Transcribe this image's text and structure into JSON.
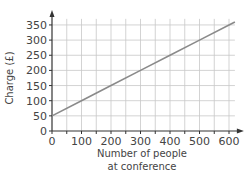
{
  "chart_data": {
    "type": "line",
    "title": "",
    "xlabel": "Number of people at conference",
    "xlabel_lines": [
      "Number of people",
      "at conference"
    ],
    "ylabel": "Charge (£)",
    "x_ticks": [
      0,
      100,
      200,
      300,
      400,
      500,
      600
    ],
    "y_ticks": [
      0,
      50,
      100,
      150,
      200,
      250,
      300,
      350
    ],
    "xlim": [
      0,
      620
    ],
    "ylim": [
      0,
      370
    ],
    "grid": true,
    "grid_step_x": 50,
    "grid_step_y": 50,
    "legend": null,
    "series": [
      {
        "name": "Charge",
        "x": [
          0,
          100,
          200,
          300,
          400,
          500,
          600,
          620
        ],
        "y": [
          50,
          100,
          150,
          200,
          250,
          300,
          350,
          360
        ],
        "color": "#8a8a8a"
      }
    ]
  },
  "colors": {
    "line": "#8a8a8a",
    "grid": "#c8c8c8",
    "axis": "#333333"
  }
}
